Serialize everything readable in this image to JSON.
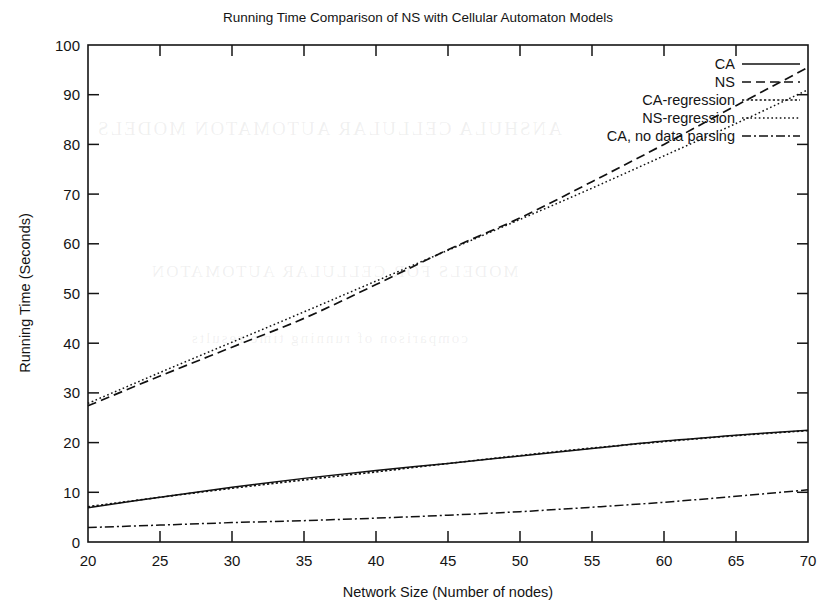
{
  "figure": {
    "title": "Running Time Comparison of NS with Cellular Automaton Models",
    "background_ghost_text": [
      "ANSHULA CELLULAR AUTOMATON MODELS",
      "MODELS FOR CELLULAR AUTOMATON",
      "comparison of running time results"
    ]
  },
  "chart_data": {
    "type": "line",
    "title": "Running Time Comparison of NS with Cellular Automaton Models",
    "xlabel": "Network Size (Number of nodes)",
    "ylabel": "Running Time (Seconds)",
    "xlim": [
      20,
      70
    ],
    "ylim": [
      0,
      100
    ],
    "xticks": [
      20,
      25,
      30,
      35,
      40,
      45,
      50,
      55,
      60,
      65,
      70
    ],
    "yticks": [
      0,
      10,
      20,
      30,
      40,
      50,
      60,
      70,
      80,
      90,
      100
    ],
    "grid": false,
    "legend_position": "top-right",
    "x": [
      20,
      25,
      30,
      35,
      40,
      45,
      50,
      55,
      60,
      65,
      70
    ],
    "series": [
      {
        "name": "CA",
        "style": "solid",
        "values": [
          6.9,
          9.0,
          11.0,
          12.8,
          14.4,
          15.8,
          17.3,
          18.8,
          20.3,
          21.5,
          22.5
        ]
      },
      {
        "name": "NS",
        "style": "dashed",
        "values": [
          27.4,
          33.4,
          39.2,
          45.0,
          51.8,
          58.8,
          65.2,
          72.5,
          80.0,
          87.8,
          95.5
        ]
      },
      {
        "name": "CA-regression",
        "style": "dotted",
        "values": [
          7.1,
          9.0,
          10.8,
          12.5,
          14.1,
          15.8,
          17.4,
          18.9,
          20.2,
          21.4,
          22.4
        ]
      },
      {
        "name": "NS-regression",
        "style": "fine-dotted",
        "values": [
          27.9,
          34.1,
          40.2,
          46.3,
          52.5,
          58.7,
          64.9,
          71.2,
          77.7,
          84.2,
          91.0
        ]
      },
      {
        "name": "CA, no data parsing",
        "style": "dash-dot",
        "values": [
          2.9,
          3.4,
          3.9,
          4.3,
          4.8,
          5.4,
          6.1,
          7.0,
          8.0,
          9.2,
          10.5
        ]
      }
    ]
  },
  "legend": {
    "entries": [
      {
        "label": "CA",
        "style": "solid"
      },
      {
        "label": "NS",
        "style": "dashed"
      },
      {
        "label": "CA-regression",
        "style": "dotted"
      },
      {
        "label": "NS-regression",
        "style": "fine-dotted"
      },
      {
        "label": "CA, no data parsing",
        "style": "dash-dot"
      }
    ]
  }
}
